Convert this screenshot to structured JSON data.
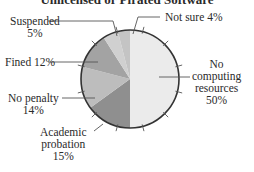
{
  "chart_data": {
    "type": "pie",
    "title": "Unlicensed or Pirated Software",
    "start_angle": "12 o'clock, clockwise",
    "slices": [
      {
        "label": "No computing resources",
        "value": 50,
        "color": "#ebebeb"
      },
      {
        "label": "Academic probation",
        "value": 15,
        "color": "#8f8f8f"
      },
      {
        "label": "No penalty",
        "value": 14,
        "color": "#bdbdbd"
      },
      {
        "label": "Fined",
        "value": 12,
        "color": "#a3a3a3"
      },
      {
        "label": "Suspended",
        "value": 5,
        "color": "#d0d0d0"
      },
      {
        "label": "Not sure",
        "value": 4,
        "color": "#c4c4c4"
      }
    ],
    "labels_display": {
      "no_computing": [
        "No",
        "computing",
        "resources",
        "50%"
      ],
      "academic": [
        "Academic",
        "probation",
        "15%"
      ],
      "no_penalty": [
        "No penalty",
        "14%"
      ],
      "fined": "Fined 12%",
      "suspended": [
        "Suspended",
        "5%"
      ],
      "not_sure": "Not sure 4%"
    }
  }
}
